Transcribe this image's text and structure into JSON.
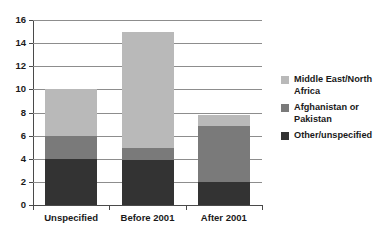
{
  "chart_data": {
    "type": "bar",
    "stacked": true,
    "title": "",
    "xlabel": "",
    "ylabel": "",
    "categories": [
      "Unspecified",
      "Before 2001",
      "After 2001"
    ],
    "ylim": [
      0,
      16
    ],
    "yticks": [
      0,
      2,
      4,
      6,
      8,
      10,
      12,
      14,
      16
    ],
    "ytick_labels": [
      "0",
      "2",
      "4",
      "6",
      "8",
      "10",
      "12",
      "14",
      "16"
    ],
    "grid": true,
    "legend_position": "right",
    "series": [
      {
        "name": "Other/unspecified",
        "color": "#333333",
        "values": [
          4,
          3.9,
          2
        ]
      },
      {
        "name": "Afghanistan or Pakistan",
        "color": "#7a7a7a",
        "values": [
          2,
          1.0,
          4.8
        ]
      },
      {
        "name": "Middle East/North Africa",
        "color": "#b9b9b9",
        "values": [
          4,
          10.1,
          1.0
        ]
      }
    ],
    "totals": [
      10,
      15,
      7.8
    ]
  },
  "legend": {
    "items": [
      {
        "label": "Middle East/North Africa",
        "color": "#b9b9b9"
      },
      {
        "label": "Afghanistan or Pakistan",
        "color": "#7a7a7a"
      },
      {
        "label": "Other/unspecified",
        "color": "#333333"
      }
    ]
  },
  "colors": {
    "axis": "#4a4a4a",
    "grid": "#8d8d8d",
    "background": "#ffffff",
    "text": "#1a1a1a"
  }
}
